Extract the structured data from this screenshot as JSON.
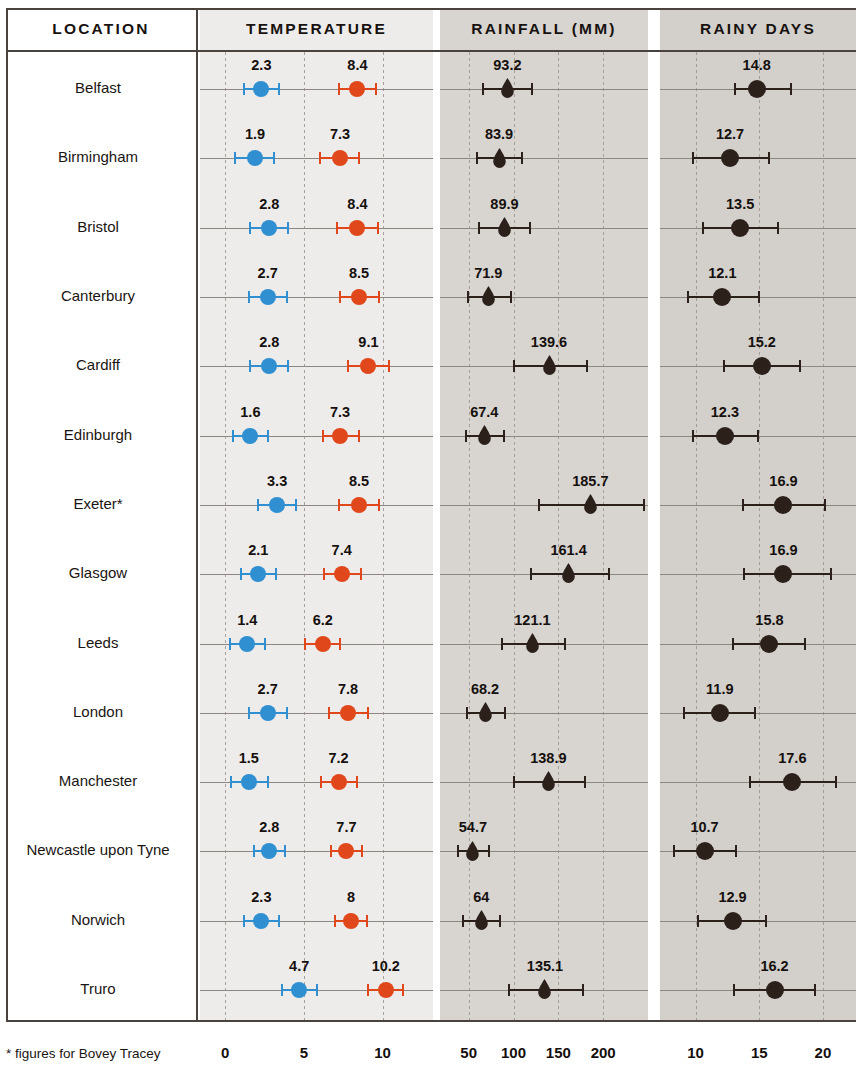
{
  "headers": {
    "location": "LOCATION",
    "temperature": "TEMPERATURE",
    "rainfall": "RAINFALL (MM)",
    "rainy_days": "RAINY DAYS"
  },
  "footnote": "* figures for Bovey Tracey",
  "colors": {
    "min_temp": "#2f8fd0",
    "max_temp": "#e0481c",
    "rain": "#2b201a",
    "days": "#2b201a",
    "panel_temp": "#eeeceb",
    "panel_rain": "#d8d4d0",
    "panel_days": "#d3cfcb",
    "rule": "#4a423c",
    "baseline": "#8d8782"
  },
  "chart_data": {
    "type": "scatter",
    "title": "",
    "subtitle": "",
    "layout": "small-multiples dot plot with error bars; rows = locations, three metric panels",
    "legend_position": "none",
    "grid": true,
    "panels": [
      {
        "name": "temperature",
        "label": "TEMPERATURE",
        "xlabel": "",
        "ticks": [
          0,
          5,
          10
        ],
        "tick_labels": [
          "0",
          "5",
          "10"
        ],
        "xlim": [
          -1.6,
          13.2
        ],
        "series": [
          {
            "name": "min_temp",
            "color": "#2f8fd0",
            "marker": "circle"
          },
          {
            "name": "max_temp",
            "color": "#e0481c",
            "marker": "circle"
          }
        ]
      },
      {
        "name": "rainfall",
        "label": "RAINFALL (MM)",
        "xlabel": "",
        "ticks": [
          50,
          100,
          150,
          200
        ],
        "tick_labels": [
          "50",
          "100",
          "150",
          "200"
        ],
        "xlim": [
          18,
          250
        ],
        "series": [
          {
            "name": "rainfall_mm",
            "color": "#2b201a",
            "marker": "raindrop"
          }
        ]
      },
      {
        "name": "rainy_days",
        "label": "RAINY DAYS",
        "xlabel": "",
        "ticks": [
          10,
          15,
          20
        ],
        "tick_labels": [
          "10",
          "15",
          "20"
        ],
        "xlim": [
          7.2,
          22.6
        ],
        "series": [
          {
            "name": "rainy_days",
            "color": "#2b201a",
            "marker": "circle"
          }
        ]
      }
    ],
    "categories": [
      "Belfast",
      "Birmingham",
      "Bristol",
      "Canterbury",
      "Cardiff",
      "Edinburgh",
      "Exeter*",
      "Glasgow",
      "Leeds",
      "London",
      "Manchester",
      "Newcastle upon Tyne",
      "Norwich",
      "Truro"
    ],
    "rows": [
      {
        "location": "Belfast",
        "min_temp": {
          "value": 2.3,
          "label": "2.3",
          "low": 1.2,
          "high": 3.4
        },
        "max_temp": {
          "value": 8.4,
          "label": "8.4",
          "low": 7.2,
          "high": 9.6
        },
        "rainfall": {
          "value": 93.2,
          "label": "93.2",
          "low": 66,
          "high": 121
        },
        "rainy_days": {
          "value": 14.8,
          "label": "14.8",
          "low": 13.1,
          "high": 17.5
        }
      },
      {
        "location": "Birmingham",
        "min_temp": {
          "value": 1.9,
          "label": "1.9",
          "low": 0.6,
          "high": 3.1
        },
        "max_temp": {
          "value": 7.3,
          "label": "7.3",
          "low": 6.0,
          "high": 8.5
        },
        "rainfall": {
          "value": 83.9,
          "label": "83.9",
          "low": 59,
          "high": 110
        },
        "rainy_days": {
          "value": 12.7,
          "label": "12.7",
          "low": 9.8,
          "high": 15.8
        }
      },
      {
        "location": "Bristol",
        "min_temp": {
          "value": 2.8,
          "label": "2.8",
          "low": 1.6,
          "high": 4.0
        },
        "max_temp": {
          "value": 8.4,
          "label": "8.4",
          "low": 7.1,
          "high": 9.7
        },
        "rainfall": {
          "value": 89.9,
          "label": "89.9",
          "low": 62,
          "high": 118
        },
        "rainy_days": {
          "value": 13.5,
          "label": "13.5",
          "low": 10.6,
          "high": 16.5
        }
      },
      {
        "location": "Canterbury",
        "min_temp": {
          "value": 2.7,
          "label": "2.7",
          "low": 1.5,
          "high": 3.9
        },
        "max_temp": {
          "value": 8.5,
          "label": "8.5",
          "low": 7.3,
          "high": 9.8
        },
        "rainfall": {
          "value": 71.9,
          "label": "71.9",
          "low": 49,
          "high": 97
        },
        "rainy_days": {
          "value": 12.1,
          "label": "12.1",
          "low": 9.4,
          "high": 15.0
        }
      },
      {
        "location": "Cardiff",
        "min_temp": {
          "value": 2.8,
          "label": "2.8",
          "low": 1.6,
          "high": 4.0
        },
        "max_temp": {
          "value": 9.1,
          "label": "9.1",
          "low": 7.8,
          "high": 10.4
        },
        "rainfall": {
          "value": 139.6,
          "label": "139.6",
          "low": 100,
          "high": 182
        },
        "rainy_days": {
          "value": 15.2,
          "label": "15.2",
          "low": 12.2,
          "high": 18.2
        }
      },
      {
        "location": "Edinburgh",
        "min_temp": {
          "value": 1.6,
          "label": "1.6",
          "low": 0.5,
          "high": 2.7
        },
        "max_temp": {
          "value": 7.3,
          "label": "7.3",
          "low": 6.2,
          "high": 8.5
        },
        "rainfall": {
          "value": 67.4,
          "label": "67.4",
          "low": 47,
          "high": 89
        },
        "rainy_days": {
          "value": 12.3,
          "label": "12.3",
          "low": 9.8,
          "high": 14.9
        }
      },
      {
        "location": "Exeter*",
        "min_temp": {
          "value": 3.3,
          "label": "3.3",
          "low": 2.1,
          "high": 4.5
        },
        "max_temp": {
          "value": 8.5,
          "label": "8.5",
          "low": 7.2,
          "high": 9.8
        },
        "rainfall": {
          "value": 185.7,
          "label": "185.7",
          "low": 128,
          "high": 246
        },
        "rainy_days": {
          "value": 16.9,
          "label": "16.9",
          "low": 13.7,
          "high": 20.2
        }
      },
      {
        "location": "Glasgow",
        "min_temp": {
          "value": 2.1,
          "label": "2.1",
          "low": 1.0,
          "high": 3.2
        },
        "max_temp": {
          "value": 7.4,
          "label": "7.4",
          "low": 6.3,
          "high": 8.6
        },
        "rainfall": {
          "value": 161.4,
          "label": "161.4",
          "low": 119,
          "high": 206
        },
        "rainy_days": {
          "value": 16.9,
          "label": "16.9",
          "low": 13.8,
          "high": 20.6
        }
      },
      {
        "location": "Leeds",
        "min_temp": {
          "value": 1.4,
          "label": "1.4",
          "low": 0.3,
          "high": 2.5
        },
        "max_temp": {
          "value": 6.2,
          "label": "6.2",
          "low": 5.1,
          "high": 7.3
        },
        "rainfall": {
          "value": 121.1,
          "label": "121.1",
          "low": 87,
          "high": 157
        },
        "rainy_days": {
          "value": 15.8,
          "label": "15.8",
          "low": 12.9,
          "high": 18.6
        }
      },
      {
        "location": "London",
        "min_temp": {
          "value": 2.7,
          "label": "2.7",
          "low": 1.5,
          "high": 3.9
        },
        "max_temp": {
          "value": 7.8,
          "label": "7.8",
          "low": 6.6,
          "high": 9.1
        },
        "rainfall": {
          "value": 68.2,
          "label": "68.2",
          "low": 48,
          "high": 90
        },
        "rainy_days": {
          "value": 11.9,
          "label": "11.9",
          "low": 9.1,
          "high": 14.7
        }
      },
      {
        "location": "Manchester",
        "min_temp": {
          "value": 1.5,
          "label": "1.5",
          "low": 0.4,
          "high": 2.7
        },
        "max_temp": {
          "value": 7.2,
          "label": "7.2",
          "low": 6.1,
          "high": 8.4
        },
        "rainfall": {
          "value": 138.9,
          "label": "138.9",
          "low": 100,
          "high": 180
        },
        "rainy_days": {
          "value": 17.6,
          "label": "17.6",
          "low": 14.3,
          "high": 21.0
        }
      },
      {
        "location": "Newcastle upon Tyne",
        "min_temp": {
          "value": 2.8,
          "label": "2.8",
          "low": 1.8,
          "high": 3.8
        },
        "max_temp": {
          "value": 7.7,
          "label": "7.7",
          "low": 6.7,
          "high": 8.7
        },
        "rainfall": {
          "value": 54.7,
          "label": "54.7",
          "low": 38,
          "high": 73
        },
        "rainy_days": {
          "value": 10.7,
          "label": "10.7",
          "low": 8.3,
          "high": 13.2
        }
      },
      {
        "location": "Norwich",
        "min_temp": {
          "value": 2.3,
          "label": "2.3",
          "low": 1.2,
          "high": 3.4
        },
        "max_temp": {
          "value": 8.0,
          "label": "8",
          "low": 7.0,
          "high": 9.0
        },
        "rainfall": {
          "value": 64.0,
          "label": "64",
          "low": 44,
          "high": 85
        },
        "rainy_days": {
          "value": 12.9,
          "label": "12.9",
          "low": 10.2,
          "high": 15.5
        }
      },
      {
        "location": "Truro",
        "min_temp": {
          "value": 4.7,
          "label": "4.7",
          "low": 3.6,
          "high": 5.8
        },
        "max_temp": {
          "value": 10.2,
          "label": "10.2",
          "low": 9.1,
          "high": 11.3
        },
        "rainfall": {
          "value": 135.1,
          "label": "135.1",
          "low": 95,
          "high": 178
        },
        "rainy_days": {
          "value": 16.2,
          "label": "16.2",
          "low": 13.0,
          "high": 19.4
        }
      }
    ]
  }
}
